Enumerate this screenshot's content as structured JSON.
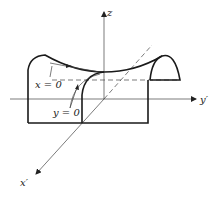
{
  "figure": {
    "axes": {
      "z_label": "z",
      "y_label": "y′",
      "x_label": "x′"
    },
    "annotations": [
      {
        "text": "x = 0",
        "points_to": "curve along y direction"
      },
      {
        "text": "y = 0",
        "points_to": "curve along x direction"
      }
    ]
  }
}
